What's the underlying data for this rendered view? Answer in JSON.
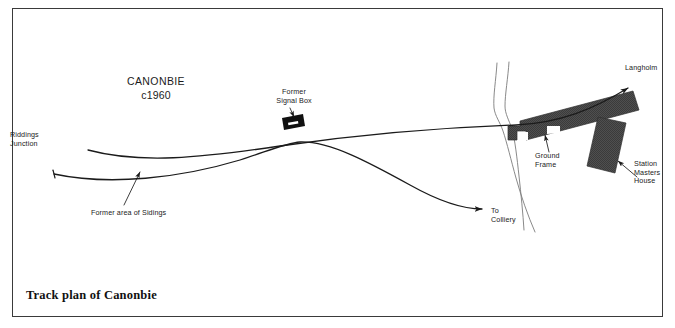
{
  "figure": {
    "caption": "Track plan of Canonbie",
    "frame_color": "#3a3a3a",
    "background": "#ffffff",
    "line_color": "#1b1b1b",
    "building_fill": "#4a4a4a",
    "width": 675,
    "height": 328
  },
  "heading": {
    "place": "CANONBIE",
    "year": "c1960"
  },
  "labels": {
    "riddings_junction": "Riddings\nJunction",
    "former_sidings": "Former area of Sidings",
    "former_signal_box": "Former\nSignal Box",
    "to_colliery": "To\nColliery",
    "ground_frame": "Ground\nFrame",
    "station_masters_house": "Station\nMasters\nHouse",
    "langholm": "Langholm"
  },
  "map_features": [
    {
      "name": "main-line-track",
      "type": "railway-line",
      "description": "main running line from Riddings Junction to Langholm"
    },
    {
      "name": "colliery-branch-track",
      "type": "railway-line",
      "description": "curving branch line to Colliery"
    },
    {
      "name": "siding-stub-track",
      "type": "railway-line",
      "description": "former siding stub"
    },
    {
      "name": "river-watercourse",
      "type": "watercourse",
      "description": "stream crossing the plan"
    },
    {
      "name": "station-platform-building",
      "type": "building",
      "description": "station platform and buildings"
    },
    {
      "name": "station-masters-house-building",
      "type": "building",
      "description": "station masters house"
    },
    {
      "name": "signal-box-symbol",
      "type": "structure",
      "description": "former signal box"
    }
  ]
}
